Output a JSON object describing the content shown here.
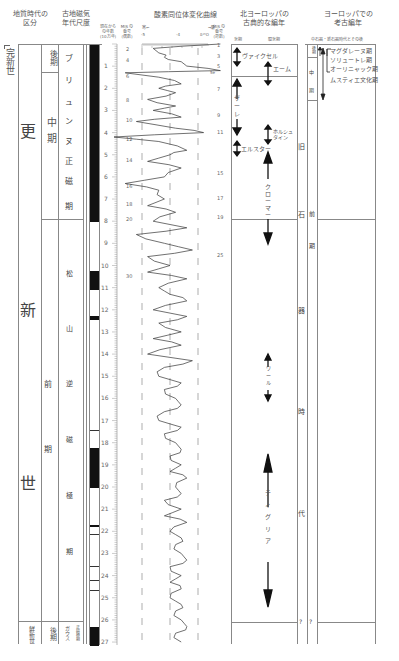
{
  "headers": {
    "geologic_time": "地質時代の\n区分",
    "paleomag": "古地磁気\n年代尺度",
    "age_axis": "現在から\nの年数\n(10万年)",
    "mis_odd_even": "MIS の\n番号\n(偶数)",
    "oxygen_curve_title": "酸素同位体変化曲線",
    "cold_label": "寒←",
    "warm_label": "→暖",
    "axis_ticks": [
      "-5",
      "-4",
      "δ¹⁸O"
    ],
    "mis_odd": "MIS の\n番号\n(奇数)",
    "north_europe": "北ヨーロッパの\n古典的な編年",
    "glacial": "氷期",
    "interglacial": "間氷期",
    "europe_arch": "ヨーロッパでの\n考古編年",
    "mesolithic_note": "中石器・新石器時代とその後"
  },
  "epochs": {
    "holocene": "完新世",
    "pleistocene": [
      "更",
      "新",
      "世"
    ],
    "pliocene": "鮮新世"
  },
  "sub_periods": {
    "late": "後期",
    "middle": "中期",
    "early": [
      "前",
      "期"
    ],
    "pliocene_late": "後期"
  },
  "paleomag_chrons": {
    "brunhes": [
      "ブ",
      "リ",
      "ュ",
      "ン",
      "ヌ",
      "正",
      "磁",
      "極",
      "期"
    ],
    "matuyama": [
      "松",
      "山",
      "逆",
      "磁",
      "極",
      "期"
    ],
    "gauss": "ガウス",
    "gauss_type": "正磁極期"
  },
  "age_ticks": [
    "1",
    "2",
    "3",
    "4",
    "5",
    "6",
    "7",
    "8",
    "9",
    "10",
    "11",
    "12",
    "13",
    "14",
    "15",
    "16",
    "17",
    "18",
    "19",
    "20",
    "21",
    "22",
    "23",
    "24",
    "25",
    "26",
    "27"
  ],
  "mis_even": [
    {
      "label": "2",
      "y": 49
    },
    {
      "label": "4",
      "y": 60
    },
    {
      "label": "6",
      "y": 76
    },
    {
      "label": "8",
      "y": 100
    },
    {
      "label": "10",
      "y": 120
    },
    {
      "label": "12",
      "y": 139
    },
    {
      "label": "14",
      "y": 160
    },
    {
      "label": "16",
      "y": 186
    },
    {
      "label": "18",
      "y": 204
    },
    {
      "label": "20",
      "y": 219
    },
    {
      "label": "30",
      "y": 276
    }
  ],
  "mis_odd": [
    {
      "label": "1",
      "y": 45
    },
    {
      "label": "3",
      "y": 56
    },
    {
      "label": "5",
      "y": 66
    },
    {
      "label": "5e",
      "y": 73
    },
    {
      "label": "7",
      "y": 89
    },
    {
      "label": "9",
      "y": 115
    },
    {
      "label": "11",
      "y": 132
    },
    {
      "label": "15",
      "y": 173
    },
    {
      "label": "17",
      "y": 198
    },
    {
      "label": "19",
      "y": 217
    },
    {
      "label": "25",
      "y": 255
    }
  ],
  "north_europe_stages": {
    "weichsel": "ヴァイクセル",
    "eem": "エーム",
    "saale": [
      "ザ",
      "ー",
      "レ"
    ],
    "holstein": "ホルシュ\nタイン",
    "elster": "エルスター",
    "cromer": [
      "ク",
      "ロ",
      "ー",
      "マ",
      "ー"
    ],
    "waal": [
      "ワ",
      "ー",
      "ル"
    ],
    "tiglian": [
      "テ",
      "ィ",
      "グ",
      "リ",
      "ア"
    ]
  },
  "archaeology": {
    "paleolithic": [
      "旧",
      "石",
      "器",
      "時",
      "代"
    ],
    "late_pal": "後期",
    "middle_pal": [
      "中",
      "期"
    ],
    "early_pal": [
      "前",
      "期"
    ],
    "question_marks": [
      "?",
      "?"
    ],
    "cultures": [
      "マグダレーヌ期",
      "ソリュートレ期",
      "オーリニャック期",
      "ムスティエ文化期"
    ]
  },
  "chart_data": {
    "type": "line",
    "title": "酸素同位体変化曲線",
    "xlabel": "δ¹⁸O (寒← →暖)",
    "ylabel": "現在からの年数 (10万年)",
    "ylim": [
      0,
      27
    ],
    "xlim": [
      -5.5,
      -3.5
    ],
    "orientation": "vertical",
    "series": [
      {
        "name": "δ18O",
        "y": [
          0.0,
          0.2,
          0.4,
          0.6,
          0.8,
          1.0,
          1.2,
          1.3,
          1.5,
          1.8,
          2.0,
          2.2,
          2.5,
          2.8,
          3.0,
          3.3,
          3.5,
          3.8,
          4.0,
          4.2,
          4.4,
          4.8,
          5.0,
          5.3,
          5.6,
          6.0,
          6.3,
          6.6,
          7.0,
          7.3,
          7.6,
          8.0,
          8.3,
          8.6,
          9.0,
          9.3,
          9.6,
          10.0,
          10.3,
          10.6,
          11.0,
          11.3,
          11.6,
          12.0,
          12.3,
          12.6,
          13.0,
          13.3,
          13.6,
          14.0,
          14.3,
          14.6,
          15.0,
          15.3,
          15.6,
          16.0,
          16.3,
          16.6,
          17.0,
          17.3,
          17.6,
          18.0,
          18.3,
          18.6,
          19.0,
          19.3,
          19.6,
          20.0,
          20.3,
          20.6,
          21.0,
          21.3,
          21.6,
          22.0,
          22.3,
          22.6,
          23.0,
          23.3,
          23.6,
          24.0,
          24.3,
          24.6,
          25.0,
          25.3,
          25.6,
          26.0,
          26.3,
          26.6,
          27.0
        ],
        "values": [
          -3.6,
          -4.8,
          -4.7,
          -4.6,
          -4.3,
          -4.2,
          -3.6,
          -5.3,
          -4.7,
          -4.3,
          -4.7,
          -4.4,
          -4.9,
          -4.4,
          -4.8,
          -4.3,
          -5.1,
          -4.4,
          -3.9,
          -5.5,
          -4.7,
          -4.2,
          -4.5,
          -4.9,
          -4.3,
          -4.6,
          -5.3,
          -4.7,
          -4.6,
          -4.9,
          -4.4,
          -4.8,
          -4.2,
          -5.1,
          -4.6,
          -4.1,
          -4.9,
          -4.5,
          -4.9,
          -4.2,
          -4.7,
          -4.5,
          -4.2,
          -4.8,
          -4.2,
          -4.7,
          -4.3,
          -4.8,
          -4.3,
          -4.9,
          -4.1,
          -4.6,
          -4.7,
          -4.3,
          -4.6,
          -4.4,
          -4.3,
          -4.6,
          -4.7,
          -4.3,
          -4.6,
          -4.4,
          -4.3,
          -4.5,
          -4.3,
          -4.5,
          -4.2,
          -4.4,
          -4.3,
          -4.6,
          -4.3,
          -4.6,
          -4.2,
          -4.5,
          -4.3,
          -4.4,
          -4.3,
          -4.2,
          -4.5,
          -4.3,
          -4.5,
          -4.3,
          -4.5,
          -4.3,
          -4.4,
          -4.3,
          -4.2,
          -4.4,
          -4.3
        ]
      }
    ],
    "paleomag_blocks_normal": [
      [
        0,
        7.8
      ],
      [
        9.9,
        10.7
      ],
      [
        12.1,
        12.2
      ],
      [
        16.9,
        16.9
      ],
      [
        17.8,
        19.5
      ],
      [
        21.3,
        21.4
      ],
      [
        21.8,
        21.8
      ],
      [
        23.3,
        23.3
      ],
      [
        23.9,
        23.9
      ],
      [
        24.3,
        24.3
      ],
      [
        25.8,
        27.0
      ]
    ],
    "dashed_reference_lines": [
      -5,
      -4.5,
      -4
    ],
    "grid": false
  }
}
